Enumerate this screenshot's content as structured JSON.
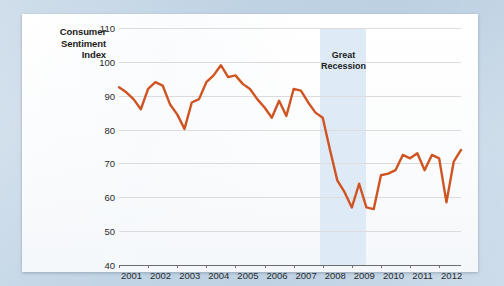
{
  "chart_data": {
    "type": "line",
    "title": "",
    "ylabel": "Consumer Sentiment Index",
    "xlabel": "",
    "ylim": [
      40,
      110
    ],
    "yticks": [
      40,
      50,
      60,
      70,
      80,
      90,
      100,
      110
    ],
    "xlim": [
      2001.0,
      2012.75
    ],
    "xticks": [
      2001,
      2002,
      2003,
      2004,
      2005,
      2006,
      2007,
      2008,
      2009,
      2010,
      2011,
      2012
    ],
    "xtick_labels": [
      "2001",
      "2002",
      "2003",
      "2004",
      "2005",
      "2006",
      "2007",
      "2008",
      "2009",
      "2010",
      "2011",
      "2012"
    ],
    "grid": true,
    "legend": false,
    "line_color": "#cf5422",
    "line_width": 2.4,
    "annotations": [
      {
        "name": "great-recession",
        "label": "Great\nRecession",
        "label_line1": "Great",
        "label_line2": "Recession",
        "type": "vspan",
        "x_start": 2007.92,
        "x_end": 2009.5,
        "color": "#dfeaf7"
      }
    ],
    "series": [
      {
        "name": "Consumer Sentiment Index",
        "color": "#cf5422",
        "x": [
          2001.0,
          2001.25,
          2001.5,
          2001.75,
          2002.0,
          2002.25,
          2002.5,
          2002.75,
          2003.0,
          2003.25,
          2003.5,
          2003.75,
          2004.0,
          2004.25,
          2004.5,
          2004.75,
          2005.0,
          2005.25,
          2005.5,
          2005.75,
          2006.0,
          2006.25,
          2006.5,
          2006.75,
          2007.0,
          2007.25,
          2007.5,
          2007.75,
          2008.0,
          2008.25,
          2008.5,
          2008.75,
          2009.0,
          2009.25,
          2009.5,
          2009.75,
          2010.0,
          2010.25,
          2010.5,
          2010.75,
          2011.0,
          2011.25,
          2011.5,
          2011.75,
          2012.0,
          2012.25,
          2012.5,
          2012.75
        ],
        "y": [
          92.5,
          91.0,
          89.0,
          86.0,
          92.0,
          94.0,
          93.0,
          87.5,
          84.5,
          80.2,
          88.0,
          89.0,
          94.0,
          96.0,
          99.0,
          95.5,
          96.0,
          93.5,
          92.0,
          89.0,
          86.5,
          83.5,
          88.5,
          84.0,
          92.0,
          91.5,
          88.0,
          85.0,
          83.5,
          74.0,
          65.0,
          61.5,
          57.0,
          64.0,
          57.0,
          56.5,
          66.5,
          67.0,
          68.0,
          72.5,
          71.5,
          73.0,
          68.0,
          72.5,
          71.5,
          58.5,
          70.5,
          74.0
        ]
      }
    ]
  },
  "axis_label": {
    "line1": "Consumer",
    "line2": "Sentiment",
    "line3": "Index"
  }
}
